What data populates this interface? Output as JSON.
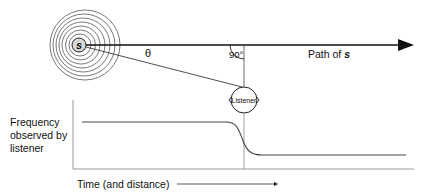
{
  "diagram": {
    "source": {
      "label": "s",
      "center": [
        79,
        45
      ],
      "radius": 7,
      "fill": "#d9d9d9",
      "wave_radii": [
        11,
        15,
        19,
        23,
        27,
        31,
        35
      ]
    },
    "path": {
      "label_prefix": "Path of ",
      "label_var": "s",
      "y": 45,
      "x_start": 86,
      "x_end": 414
    },
    "angles": {
      "theta_label": "θ",
      "right_angle_label": "90°"
    },
    "listener": {
      "label": "Listener",
      "center": [
        244,
        100
      ],
      "radius": 13
    },
    "graph": {
      "y_axis_label_lines": [
        "Frequency",
        "observed by",
        "listener"
      ],
      "x_axis_label": "Time (and distance)",
      "high_frequency_y": 122,
      "low_frequency_y": 155,
      "transition_x": 244
    },
    "colors": {
      "line": "#111111",
      "axis": "#999999",
      "curve": "#444444"
    }
  }
}
